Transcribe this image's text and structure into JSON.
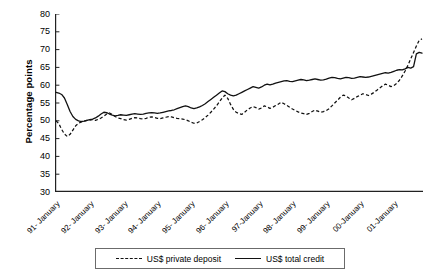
{
  "chart_data": {
    "type": "line",
    "title": "",
    "subtitle": "",
    "xlabel": "",
    "ylabel": "Percentage points",
    "ylim": [
      30,
      80
    ],
    "yticks": [
      30,
      35,
      40,
      45,
      50,
      55,
      60,
      65,
      70,
      75,
      80
    ],
    "grid": false,
    "legend_position": "bottom-center",
    "xtick_labels": [
      "91- January",
      "92- January",
      "93- January",
      "94- January",
      "95- January",
      "96- January",
      "97-January",
      "98- January",
      "99- January",
      "00-January",
      "01-January"
    ],
    "x_tick_interval": "monthly ticks, yearly labels",
    "x_start": "1991-01",
    "x_end": "2001-07",
    "series": [
      {
        "name": "US$ private deposit",
        "style": "dashed",
        "color": "#111111",
        "values": [
          50.0,
          49.2,
          47.6,
          46.3,
          45.6,
          46.2,
          47.4,
          48.6,
          49.3,
          49.7,
          49.9,
          50.1,
          50.2,
          50.3,
          50.1,
          50.4,
          50.8,
          51.3,
          51.9,
          52.2,
          51.8,
          51.2,
          50.8,
          50.6,
          50.3,
          50.2,
          50.4,
          50.7,
          50.9,
          50.8,
          50.6,
          50.5,
          50.7,
          51.0,
          51.1,
          50.9,
          50.7,
          50.6,
          50.8,
          51.0,
          51.2,
          51.1,
          50.9,
          50.7,
          50.6,
          50.5,
          50.3,
          50.0,
          49.6,
          49.3,
          49.4,
          49.8,
          50.3,
          50.9,
          51.6,
          52.4,
          53.3,
          54.2,
          55.3,
          56.4,
          57.2,
          56.3,
          54.6,
          53.2,
          52.4,
          52.0,
          51.8,
          52.4,
          53.1,
          53.6,
          54.0,
          53.7,
          53.3,
          53.6,
          54.2,
          53.9,
          53.5,
          53.8,
          54.3,
          54.7,
          55.2,
          54.8,
          54.3,
          53.8,
          53.3,
          52.9,
          52.5,
          52.2,
          52.0,
          51.8,
          52.1,
          52.6,
          53.0,
          52.7,
          52.4,
          52.6,
          52.9,
          53.4,
          54.2,
          55.0,
          55.8,
          56.6,
          57.2,
          57.0,
          56.4,
          55.9,
          56.3,
          56.8,
          57.2,
          57.6,
          57.4,
          57.1,
          57.5,
          58.0,
          58.6,
          59.2,
          59.8,
          60.3,
          60.0,
          59.6,
          59.9,
          60.5,
          61.4,
          62.6,
          64.0,
          65.6,
          67.4,
          69.2,
          71.0,
          72.6,
          73.0
        ]
      },
      {
        "name": "US$ total credit",
        "style": "solid",
        "color": "#111111",
        "values": [
          58.0,
          57.8,
          57.4,
          56.4,
          54.6,
          52.6,
          51.2,
          50.4,
          50.0,
          49.8,
          49.9,
          50.1,
          50.3,
          50.5,
          50.8,
          51.3,
          51.9,
          52.4,
          52.3,
          51.9,
          51.6,
          51.4,
          51.5,
          51.7,
          51.6,
          51.5,
          51.7,
          51.9,
          52.0,
          51.9,
          51.8,
          51.9,
          52.1,
          52.2,
          52.3,
          52.2,
          52.1,
          52.2,
          52.4,
          52.6,
          52.8,
          52.9,
          53.1,
          53.4,
          53.7,
          54.0,
          54.2,
          54.0,
          53.6,
          53.4,
          53.6,
          53.9,
          54.3,
          54.8,
          55.4,
          56.0,
          56.6,
          57.2,
          57.8,
          58.4,
          58.2,
          57.6,
          57.2,
          57.0,
          57.2,
          57.6,
          58.0,
          58.4,
          58.8,
          59.2,
          59.6,
          59.4,
          59.2,
          59.5,
          60.0,
          60.3,
          60.1,
          60.3,
          60.6,
          60.8,
          61.0,
          61.2,
          61.3,
          61.1,
          61.0,
          61.2,
          61.4,
          61.6,
          61.5,
          61.3,
          61.4,
          61.6,
          61.8,
          61.6,
          61.4,
          61.5,
          61.7,
          62.0,
          62.2,
          62.1,
          61.9,
          61.8,
          62.0,
          62.2,
          62.1,
          61.9,
          62.0,
          62.2,
          62.4,
          62.3,
          62.2,
          62.3,
          62.5,
          62.7,
          62.9,
          63.1,
          63.3,
          63.5,
          63.4,
          63.6,
          63.9,
          64.2,
          64.4,
          64.3,
          64.6,
          65.0,
          64.8,
          65.2,
          68.8,
          69.2,
          69.0
        ]
      }
    ],
    "legend": [
      {
        "label": "US$ private deposit",
        "style": "dashed"
      },
      {
        "label": "US$ total credit",
        "style": "solid"
      }
    ]
  }
}
